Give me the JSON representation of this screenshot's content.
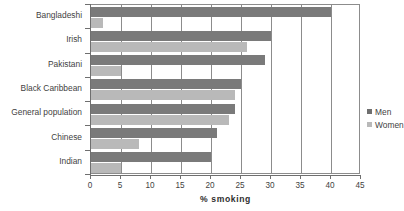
{
  "chart_data": {
    "type": "bar",
    "orientation": "horizontal",
    "title": "",
    "xlabel": "% smoking",
    "ylabel": "",
    "xlim": [
      0,
      45
    ],
    "xticks": [
      0,
      5,
      10,
      15,
      20,
      25,
      30,
      35,
      40,
      45
    ],
    "grid": true,
    "grid_axis": "x",
    "legend_position": "inside-right",
    "categories": [
      "Bangladeshi",
      "Irish",
      "Pakistani",
      "Black Caribbean",
      "General population",
      "Chinese",
      "Indian"
    ],
    "series": [
      {
        "name": "Men",
        "color": "#7a7a7a",
        "values": [
          40,
          30,
          29,
          25,
          24,
          21,
          20
        ]
      },
      {
        "name": "Women",
        "color": "#b9b9b9",
        "values": [
          2,
          26,
          5,
          24,
          23,
          8,
          5
        ]
      }
    ]
  },
  "legend": {
    "entries": [
      {
        "label": "Men",
        "swatch": "men"
      },
      {
        "label": "Women",
        "swatch": "women"
      }
    ]
  }
}
